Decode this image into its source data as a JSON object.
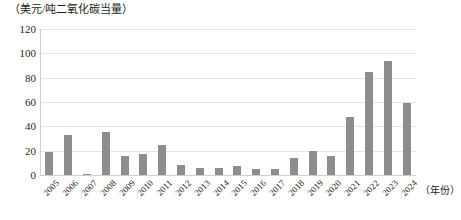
{
  "chart_data": {
    "type": "bar",
    "title": "",
    "subtitle": "",
    "ylabel": "（美元/吨二氧化碳当量）",
    "xlabel": "（年份）",
    "categories": [
      "2005",
      "2006",
      "2007",
      "2008",
      "2009",
      "2010",
      "2011",
      "2012",
      "2013",
      "2014",
      "2015",
      "2016",
      "2017",
      "2018",
      "2019",
      "2020",
      "2021",
      "2022",
      "2023",
      "2024"
    ],
    "values": [
      19,
      33,
      1,
      35,
      16,
      17,
      25,
      8,
      6,
      6,
      7,
      5,
      5,
      14,
      20,
      16,
      48,
      85,
      94,
      59
    ],
    "series": [
      {
        "name": "碳价",
        "values": [
          19,
          33,
          1,
          35,
          16,
          17,
          25,
          8,
          6,
          6,
          7,
          5,
          5,
          14,
          20,
          16,
          48,
          85,
          94,
          59
        ]
      }
    ],
    "ylim": [
      0,
      120
    ],
    "yticks": [
      0,
      20,
      40,
      60,
      80,
      100,
      120
    ],
    "ytick_labels": [
      "0",
      "20",
      "40",
      "60",
      "80",
      "100",
      "120"
    ],
    "grid": true,
    "grid_axis": "y",
    "legend": false,
    "legend_position": "none",
    "bar_color": "#8d8d8d",
    "gridline_color": "#e4e4e4",
    "axis_color": "#cfcfcf",
    "text_color": "#231f20",
    "xtick_rotation": -45
  }
}
